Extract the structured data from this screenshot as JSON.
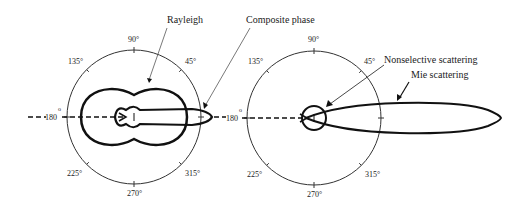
{
  "figure": {
    "left_panel": {
      "angle_labels": {
        "a90": "90°",
        "a135": "135°",
        "a45": "45°",
        "a180": "180",
        "a180_deg": "o",
        "a225": "225°",
        "a315": "315°",
        "a270": "270°"
      },
      "callouts": {
        "rayleigh": "Rayleigh",
        "composite": "Composite phase"
      }
    },
    "right_panel": {
      "angle_labels": {
        "a90": "90°",
        "a135": "135°",
        "a45": "45°",
        "a180": "180",
        "a180_deg": "o",
        "a225": "225°",
        "a315": "315°",
        "a270": "270°"
      },
      "callouts": {
        "nonselective": "Nonselective scattering",
        "mie": "Mie scattering"
      }
    }
  },
  "colors": {
    "stroke": "#111111",
    "thin": "#333333",
    "background": "#ffffff"
  }
}
